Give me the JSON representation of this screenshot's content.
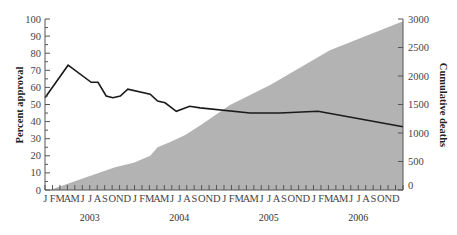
{
  "chart_data": {
    "type": "line+area",
    "title": "",
    "xlabel": "",
    "ylabel": "Percent approval",
    "y2label": "Cumulative deaths",
    "ylim": [
      0,
      100
    ],
    "y2lim": [
      0,
      3000
    ],
    "yticks": [
      0,
      10,
      20,
      30,
      40,
      50,
      60,
      70,
      80,
      90,
      100
    ],
    "y2ticks": [
      0,
      500,
      1000,
      1500,
      2000,
      2500,
      3000
    ],
    "month_labels": [
      "J",
      "F",
      "M",
      "A",
      "M",
      "J",
      "J",
      "A",
      "S",
      "O",
      "N",
      "D"
    ],
    "years": [
      "2003",
      "2004",
      "2005",
      "2006"
    ],
    "grid": false,
    "series": [
      {
        "name": "Percent approval",
        "type": "line",
        "axis": "left",
        "color": "#1a1a1a",
        "points": [
          {
            "month": 0,
            "value": 54
          },
          {
            "month": 3.1,
            "value": 73
          },
          {
            "month": 6.2,
            "value": 63
          },
          {
            "month": 7.1,
            "value": 63
          },
          {
            "month": 8.2,
            "value": 55
          },
          {
            "month": 9.1,
            "value": 54
          },
          {
            "month": 10.1,
            "value": 55
          },
          {
            "month": 11.1,
            "value": 59
          },
          {
            "month": 14.1,
            "value": 56
          },
          {
            "month": 15.1,
            "value": 52
          },
          {
            "month": 16.1,
            "value": 51
          },
          {
            "month": 17.6,
            "value": 46
          },
          {
            "month": 19.4,
            "value": 49
          },
          {
            "month": 20.8,
            "value": 48
          },
          {
            "month": 27.5,
            "value": 45
          },
          {
            "month": 31.5,
            "value": 45
          },
          {
            "month": 36.6,
            "value": 46
          },
          {
            "month": 48,
            "value": 37
          }
        ]
      },
      {
        "name": "Cumulative deaths",
        "type": "area",
        "axis": "right",
        "color": "#b3b3b3",
        "points": [
          {
            "month": 0.7,
            "value": 0
          },
          {
            "month": 2,
            "value": 60
          },
          {
            "month": 6,
            "value": 245
          },
          {
            "month": 9.4,
            "value": 400
          },
          {
            "month": 12,
            "value": 480
          },
          {
            "month": 14.1,
            "value": 600
          },
          {
            "month": 15.1,
            "value": 750
          },
          {
            "month": 16.8,
            "value": 840
          },
          {
            "month": 18.8,
            "value": 965
          },
          {
            "month": 21,
            "value": 1150
          },
          {
            "month": 24.8,
            "value": 1490
          },
          {
            "month": 30.2,
            "value": 1840
          },
          {
            "month": 38.2,
            "value": 2450
          },
          {
            "month": 48,
            "value": 2960
          }
        ]
      }
    ]
  }
}
